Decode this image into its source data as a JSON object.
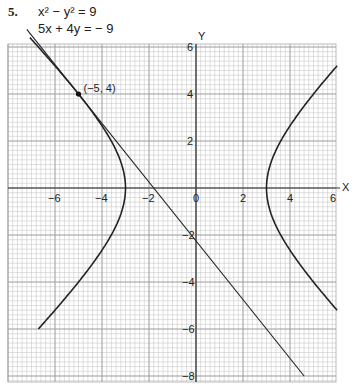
{
  "problem": {
    "number": "5.",
    "equation_1": "x² − y² = 9",
    "equation_2": "5x + 4y = − 9"
  },
  "chart_data": {
    "type": "line",
    "title": "",
    "xlabel": "X",
    "ylabel": "Y",
    "xlim": [
      -7.6,
      6
    ],
    "ylim": [
      -8,
      6
    ],
    "grid": true,
    "x_ticks": [
      -6,
      -4,
      -2,
      0,
      2,
      4,
      6
    ],
    "x_tick_labels": [
      "−6",
      "−4",
      "−2",
      "0",
      "2",
      "4",
      "6"
    ],
    "y_ticks": [
      6,
      4,
      2,
      -2,
      -4,
      -6,
      -8
    ],
    "y_tick_labels": [
      "6",
      "4",
      "2",
      "−2",
      "−4",
      "−6",
      "−8"
    ],
    "series": [
      {
        "name": "x² − y² = 9",
        "kind": "hyperbola",
        "a": 3,
        "left_branch_y_range": [
          -6,
          6.4
        ],
        "right_branch_y_range": [
          -5.2,
          5.2
        ]
      },
      {
        "name": "5x + 4y = −9",
        "kind": "line",
        "slope": -1.25,
        "intercept": -2.25,
        "x_range": [
          -7.2,
          4.6
        ]
      }
    ],
    "annotations": [
      {
        "label": "(−5, 4)",
        "x": -5,
        "y": 4
      }
    ]
  }
}
